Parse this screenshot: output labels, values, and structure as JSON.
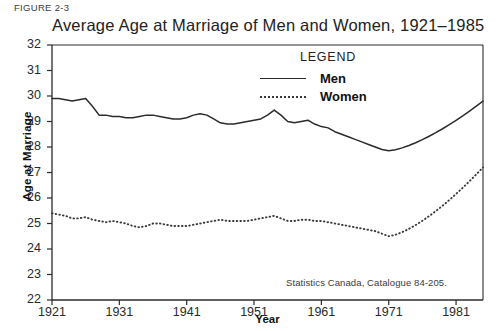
{
  "figure_label": "FIGURE 2-3",
  "source_note": "Statistics Canada, Catalogue 84-205.",
  "legend": {
    "title": "LEGEND",
    "entries": [
      {
        "label": "Men",
        "style": "solid"
      },
      {
        "label": "Women",
        "style": "dotted"
      }
    ]
  },
  "chart_data": {
    "type": "line",
    "title": "Average Age at Marriage of Men and Women, 1921–1985",
    "xlabel": "Year",
    "ylabel": "Age at Marriage",
    "xlim": [
      1921,
      1985
    ],
    "ylim": [
      22,
      32
    ],
    "grid": false,
    "legend_position": "top-center-inside",
    "xticks": [
      1921,
      1931,
      1941,
      1951,
      1961,
      1971,
      1981
    ],
    "yticks": [
      22,
      23,
      24,
      25,
      26,
      27,
      28,
      29,
      30,
      31,
      32
    ],
    "x": [
      1921,
      1922,
      1923,
      1924,
      1925,
      1926,
      1927,
      1928,
      1929,
      1930,
      1931,
      1932,
      1933,
      1934,
      1935,
      1936,
      1937,
      1938,
      1939,
      1940,
      1941,
      1942,
      1943,
      1944,
      1945,
      1946,
      1947,
      1948,
      1949,
      1950,
      1951,
      1952,
      1953,
      1954,
      1955,
      1956,
      1957,
      1958,
      1959,
      1960,
      1961,
      1962,
      1963,
      1964,
      1965,
      1966,
      1967,
      1968,
      1969,
      1970,
      1971,
      1972,
      1973,
      1974,
      1975,
      1976,
      1977,
      1978,
      1979,
      1980,
      1981,
      1982,
      1983,
      1984,
      1985
    ],
    "series": [
      {
        "name": "Men",
        "style": "solid",
        "values": [
          29.9,
          29.9,
          29.85,
          29.8,
          29.85,
          29.9,
          29.6,
          29.25,
          29.25,
          29.2,
          29.2,
          29.15,
          29.15,
          29.2,
          29.25,
          29.25,
          29.2,
          29.15,
          29.1,
          29.1,
          29.15,
          29.25,
          29.3,
          29.25,
          29.1,
          28.95,
          28.9,
          28.9,
          28.95,
          29.0,
          29.05,
          29.1,
          29.25,
          29.45,
          29.25,
          29.0,
          28.95,
          29.0,
          29.05,
          28.9,
          28.8,
          28.75,
          28.6,
          28.5,
          28.4,
          28.3,
          28.2,
          28.1,
          28.0,
          27.9,
          27.85,
          27.8,
          27.75,
          27.7,
          27.6,
          27.6,
          27.6,
          27.5,
          27.45,
          27.5,
          27.6,
          27.75,
          27.9,
          28.1,
          28.3
        ]
      },
      {
        "name": "Women",
        "style": "dotted",
        "values": [
          25.4,
          25.35,
          25.3,
          25.2,
          25.2,
          25.25,
          25.15,
          25.1,
          25.05,
          25.1,
          25.05,
          25.0,
          24.9,
          24.85,
          24.9,
          25.0,
          25.0,
          24.95,
          24.9,
          24.9,
          24.9,
          24.95,
          25.0,
          25.05,
          25.1,
          25.15,
          25.1,
          25.1,
          25.1,
          25.1,
          25.15,
          25.2,
          25.25,
          25.3,
          25.2,
          25.1,
          25.1,
          25.15,
          25.15,
          25.1,
          25.1,
          25.05,
          25.0,
          24.95,
          24.9,
          24.85,
          24.8,
          24.75,
          24.7,
          24.6,
          24.5,
          24.45,
          24.4,
          24.35,
          24.3,
          24.3,
          24.3,
          24.25,
          24.35,
          24.4,
          24.45,
          24.5,
          24.6,
          24.75,
          24.9
        ]
      }
    ],
    "series_tail": {
      "note": "rise after 1971 continues to 1985",
      "men_end": 29.8,
      "women_end": 27.2
    }
  }
}
